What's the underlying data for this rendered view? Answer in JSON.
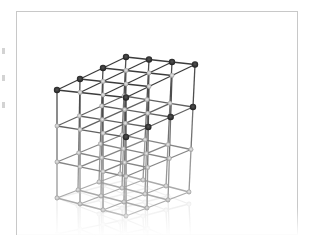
{
  "image": {
    "subject": "3D lattice cube structure",
    "description": "Rendered 3D cubic lattice of nodes connected by rods, 4x4x4 grid, dark nodes on top fading to light at bottom with reflection on floor",
    "grid_size": 4,
    "colors": {
      "background": "#ffffff",
      "frame_border": "#c8c8c8",
      "node_dark": "#2a2a2a",
      "node_light": "#bfbfbf",
      "rod": "#6a6a6a"
    }
  }
}
